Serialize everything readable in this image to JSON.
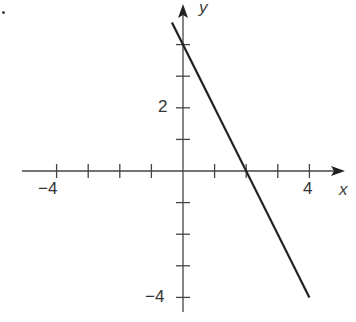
{
  "chart_data": {
    "type": "line",
    "title": "",
    "xlabel": "x",
    "ylabel": "y",
    "xlim": [
      -5.3,
      5
    ],
    "ylim": [
      -4.7,
      5.5
    ],
    "grid": false,
    "x_ticks": [
      -4,
      -3,
      -2,
      -1,
      1,
      2,
      3,
      4
    ],
    "y_ticks": [
      -4,
      -3,
      -2,
      -1,
      1,
      2,
      3,
      4
    ],
    "x_tick_labels": [
      {
        "value": -4,
        "label": "−4"
      },
      {
        "value": 4,
        "label": "4"
      }
    ],
    "y_tick_labels": [
      {
        "value": 2,
        "label": "2"
      },
      {
        "value": -4,
        "label": "−4"
      }
    ],
    "series": [
      {
        "name": "y = -2x + 4",
        "x": [
          -0.35,
          4
        ],
        "y": [
          4.7,
          -4
        ],
        "color": "#222222"
      }
    ],
    "annotations": [
      "x-intercept at (2, 0)",
      "y-intercept at (0, 4)"
    ]
  },
  "labels": {
    "x_axis": "x",
    "y_axis": "y",
    "x_neg4": "−4",
    "x_pos4": "4",
    "y_pos2": "2",
    "y_neg4": "−4"
  }
}
